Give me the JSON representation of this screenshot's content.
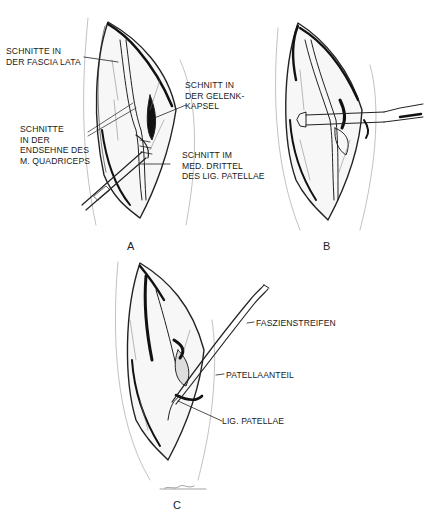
{
  "figure": {
    "panels": [
      {
        "id": "A",
        "letter": "A",
        "labels": [
          {
            "lines": [
              "SCHNITTE IN",
              "DER FASCIA LATA"
            ]
          },
          {
            "lines": [
              "SCHNITT IN",
              "DER GELENK-",
              "KAPSEL"
            ]
          },
          {
            "lines": [
              "SCHNITTE",
              "IN DER",
              "ENDSEHNE DES",
              "M. QUADRICEPS"
            ]
          },
          {
            "lines": [
              "SCHNITT IM",
              "MED. DRITTEL",
              "DES LIG. PATELLAE"
            ]
          }
        ]
      },
      {
        "id": "B",
        "letter": "B",
        "labels": []
      },
      {
        "id": "C",
        "letter": "C",
        "labels": [
          {
            "lines": [
              "FASZIENSTREIFEN"
            ]
          },
          {
            "lines": [
              "PATELLAANTEIL"
            ]
          },
          {
            "lines": [
              "LIG. PATELLAE"
            ]
          }
        ]
      }
    ]
  }
}
